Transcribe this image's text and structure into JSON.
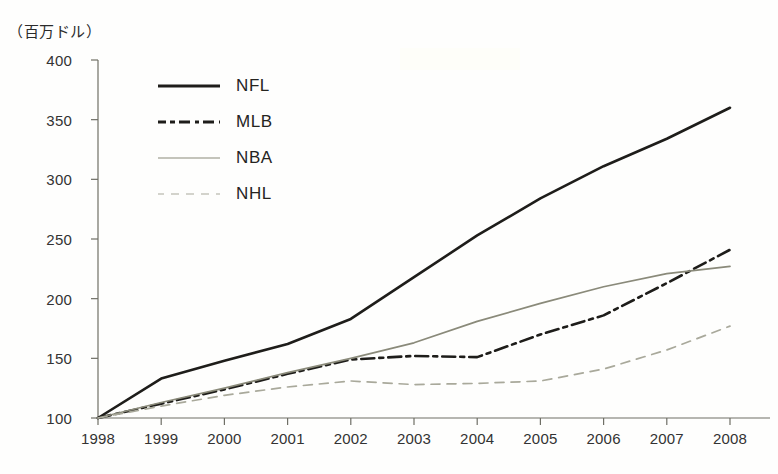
{
  "chart_data": {
    "type": "line",
    "title": "",
    "subtitle": "",
    "ylabel": "（百万ドル）",
    "xlabel": "",
    "x": [
      1998,
      1999,
      2000,
      2001,
      2002,
      2003,
      2004,
      2005,
      2006,
      2007,
      2008
    ],
    "categories": [
      "1998",
      "1999",
      "2000",
      "2001",
      "2002",
      "2003",
      "2004",
      "2005",
      "2006",
      "2007",
      "2008"
    ],
    "ylim": [
      100,
      400
    ],
    "yticks": [
      100,
      150,
      200,
      250,
      300,
      350,
      400
    ],
    "grid": false,
    "legend_position": "upper-left",
    "series": [
      {
        "name": "NFL",
        "color": "#1e1d1a",
        "style": "solid",
        "values": [
          100,
          133,
          148,
          162,
          183,
          218,
          253,
          284,
          311,
          334,
          360
        ]
      },
      {
        "name": "MLB",
        "color": "#1e1d1a",
        "style": "dash-dot",
        "values": [
          100,
          112,
          124,
          137,
          149,
          152,
          151,
          170,
          186,
          213,
          241
        ]
      },
      {
        "name": "NBA",
        "color": "#8a8a7a",
        "style": "solid-thin",
        "values": [
          100,
          113,
          125,
          138,
          150,
          163,
          181,
          196,
          210,
          221,
          227
        ]
      },
      {
        "name": "NHL",
        "color": "#a9a99b",
        "style": "dashed",
        "values": [
          100,
          110,
          119,
          126,
          131,
          128,
          129,
          131,
          141,
          157,
          177
        ]
      }
    ]
  },
  "axes": {
    "y_unit_label": "（百万ドル）",
    "y_tick_labels": [
      "400",
      "350",
      "300",
      "250",
      "200",
      "150",
      "100"
    ],
    "x_tick_labels": [
      "1998",
      "1999",
      "2000",
      "2001",
      "2002",
      "2003",
      "2004",
      "2005",
      "2006",
      "2007",
      "2008"
    ]
  },
  "legend": {
    "items": [
      {
        "label": "NFL"
      },
      {
        "label": "MLB"
      },
      {
        "label": "NBA"
      },
      {
        "label": "NHL"
      }
    ]
  },
  "colors": {
    "nfl": "#1e1d1a",
    "mlb": "#1e1d1a",
    "nba": "#8a8a7a",
    "nhl": "#a9a99b",
    "axis": "#6f6f66",
    "text": "#2b2b2b",
    "background": "#fefefd"
  }
}
